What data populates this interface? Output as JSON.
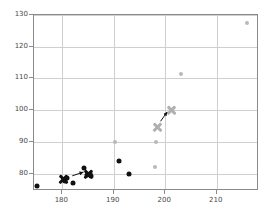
{
  "chart_data": {
    "type": "scatter",
    "title": "",
    "xlabel": "",
    "ylabel": "",
    "xlim": [
      174.5,
      218.2
    ],
    "ylim": [
      74.5,
      130.0
    ],
    "xticks": [
      180,
      190,
      200,
      210
    ],
    "yticks": [
      80,
      90,
      100,
      110,
      120,
      130
    ],
    "grid": true,
    "legend": "none",
    "colors": {
      "dark_series": "#111111",
      "light_series": "#b9b9b9",
      "grid": "#cfcfcf",
      "frame": "#8a8a8a",
      "tick_text": "#4a4a4a",
      "background": "#ffffff"
    },
    "series": [
      {
        "name": "dark-points",
        "marker": "circle",
        "color": "#111111",
        "points": [
          {
            "x": 175.0,
            "y": 76.0
          },
          {
            "x": 180.6,
            "y": 77.6
          },
          {
            "x": 181.0,
            "y": 78.6
          },
          {
            "x": 182.1,
            "y": 77.0
          },
          {
            "x": 184.3,
            "y": 81.8
          },
          {
            "x": 184.8,
            "y": 79.6
          },
          {
            "x": 185.4,
            "y": 79.8
          },
          {
            "x": 185.6,
            "y": 79.2
          },
          {
            "x": 191.0,
            "y": 84.0
          },
          {
            "x": 193.0,
            "y": 79.8
          }
        ]
      },
      {
        "name": "dark-x-markers",
        "marker": "x",
        "color": "#111111",
        "points": [
          {
            "x": 180.3,
            "y": 78.2
          },
          {
            "x": 185.1,
            "y": 79.6
          }
        ]
      },
      {
        "name": "light-points",
        "marker": "circle",
        "color": "#b9b9b9",
        "points": [
          {
            "x": 190.3,
            "y": 90.0
          },
          {
            "x": 198.0,
            "y": 82.2
          },
          {
            "x": 198.2,
            "y": 89.9
          },
          {
            "x": 203.0,
            "y": 111.5
          },
          {
            "x": 215.9,
            "y": 127.6
          }
        ]
      },
      {
        "name": "light-x-markers",
        "marker": "x",
        "color": "#b0b0b0",
        "points": [
          {
            "x": 198.5,
            "y": 94.6
          },
          {
            "x": 201.2,
            "y": 100.0
          }
        ]
      }
    ],
    "annotations": [
      {
        "type": "arrow",
        "color": "#111111",
        "from": {
          "x": 182.0,
          "y": 78.7
        },
        "to": {
          "x": 184.2,
          "y": 79.9
        }
      },
      {
        "type": "arrow",
        "color": "#111111",
        "from": {
          "x": 199.3,
          "y": 96.1
        },
        "to": {
          "x": 200.6,
          "y": 99.1
        }
      }
    ]
  }
}
